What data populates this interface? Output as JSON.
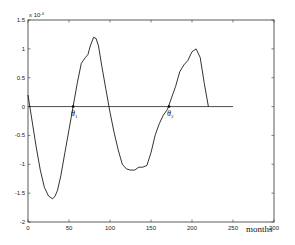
{
  "chart_data": {
    "type": "line",
    "title": "",
    "xlabel": "months",
    "ylabel": "",
    "y_multiplier_label": "x 10",
    "y_multiplier_exponent": "-4",
    "xlim": [
      0,
      300
    ],
    "ylim": [
      -2,
      1.5
    ],
    "x_ticks": [
      0,
      50,
      100,
      150,
      200,
      250,
      300
    ],
    "y_ticks": [
      -2,
      -1.5,
      -1,
      -0.5,
      0,
      0.5,
      1,
      1.5
    ],
    "grid": false,
    "reference_line": {
      "y": 0,
      "x_range": [
        0,
        250
      ]
    },
    "annotations": [
      {
        "label": "θ",
        "subscript": "1",
        "x": 55,
        "y": 0
      },
      {
        "label": "θ",
        "subscript": "2",
        "x": 172,
        "y": 0
      }
    ],
    "series": [
      {
        "name": "signal",
        "color": "#000000",
        "x": [
          0,
          5,
          10,
          15,
          20,
          25,
          30,
          33,
          36,
          40,
          45,
          50,
          55,
          60,
          65,
          70,
          73,
          76,
          80,
          83,
          86,
          90,
          95,
          100,
          105,
          110,
          115,
          120,
          125,
          130,
          135,
          140,
          145,
          150,
          155,
          160,
          165,
          170,
          175,
          180,
          185,
          190,
          195,
          200,
          205,
          210,
          215,
          220
        ],
        "values": [
          0.2,
          -0.25,
          -0.7,
          -1.1,
          -1.4,
          -1.55,
          -1.6,
          -1.55,
          -1.45,
          -1.2,
          -0.8,
          -0.4,
          0.0,
          0.4,
          0.75,
          0.85,
          0.9,
          1.05,
          1.2,
          1.18,
          1.05,
          0.7,
          0.3,
          -0.1,
          -0.45,
          -0.75,
          -1.0,
          -1.08,
          -1.1,
          -1.1,
          -1.05,
          -1.05,
          -1.02,
          -0.8,
          -0.5,
          -0.3,
          -0.15,
          -0.05,
          0.15,
          0.35,
          0.6,
          0.72,
          0.8,
          0.95,
          1.0,
          0.85,
          0.4,
          0.0
        ]
      }
    ]
  }
}
